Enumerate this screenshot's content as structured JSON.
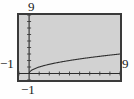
{
  "chart_data": {
    "type": "line",
    "title": "",
    "subtitle": "",
    "xlabel": "",
    "ylabel": "",
    "xlim": [
      -1,
      9
    ],
    "ylim": [
      -1,
      9
    ],
    "grid": false,
    "legend": null,
    "axis_style": "calculator-window",
    "tick_spacing_x": 1,
    "tick_spacing_y": 1,
    "series": [
      {
        "name": "y = sqrt(x)",
        "x": [
          0,
          0.25,
          0.5,
          1,
          1.5,
          2,
          2.5,
          3,
          4,
          5,
          6,
          7,
          8,
          9
        ],
        "values": [
          0,
          0.5,
          0.707,
          1,
          1.225,
          1.414,
          1.581,
          1.732,
          2,
          2.236,
          2.449,
          2.646,
          2.828,
          3
        ]
      }
    ],
    "annotations": []
  },
  "labels": {
    "y_max": "9",
    "y_min": "−1",
    "x_max": "9",
    "x_min": "−1"
  },
  "colors": {
    "plot_background": "#d2d2d2",
    "frame_border": "#3a3a3a",
    "axis": "#2a2a2a",
    "curve": "#303030",
    "page_background": "#fefefe",
    "text": "#1a1a1a"
  }
}
